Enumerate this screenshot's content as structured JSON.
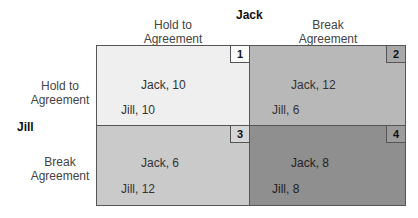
{
  "column_player": {
    "name": "Jack",
    "strategies": [
      "Hold to\nAgreement",
      "Break\nAgreement"
    ]
  },
  "row_player": {
    "name": "Jill",
    "strategies": [
      "Hold to\nAgreement",
      "Break\nAgreement"
    ]
  },
  "cells": [
    {
      "number": "1",
      "jack": "Jack, 10",
      "jill": "Jill, 10",
      "color": "#efefef"
    },
    {
      "number": "2",
      "jack": "Jack, 12",
      "jill": "Jill, 6",
      "color": "#b8b8b8"
    },
    {
      "number": "3",
      "jack": "Jack, 6",
      "jill": "Jill, 12",
      "color": "#cacaca"
    },
    {
      "number": "4",
      "jack": "Jack, 8",
      "jill": "Jill, 8",
      "color": "#8f8f8f"
    }
  ]
}
